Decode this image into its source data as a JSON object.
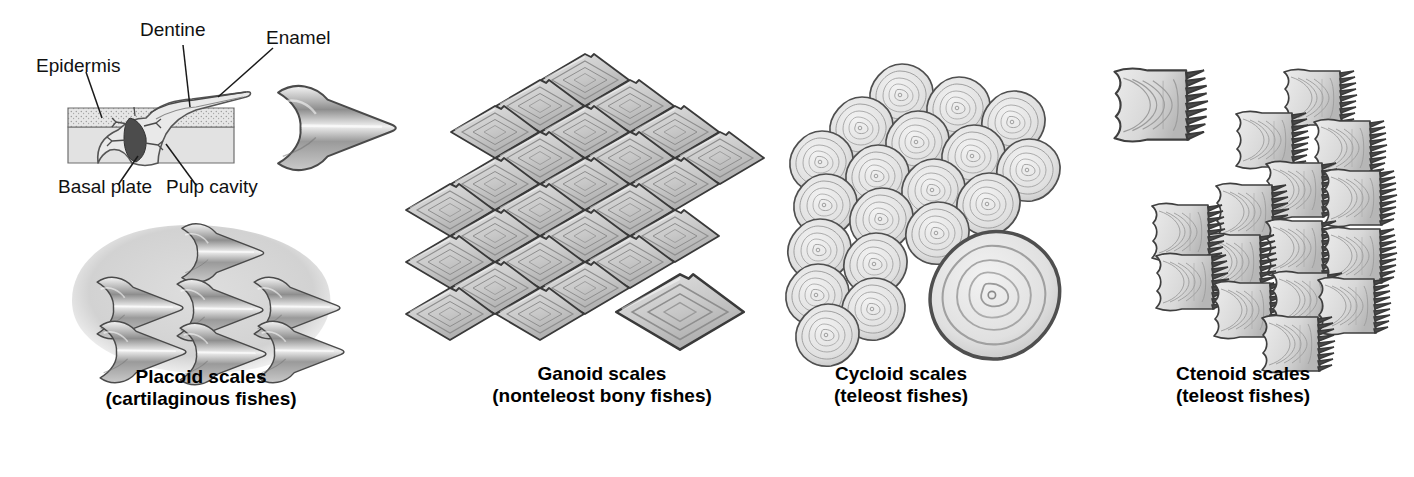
{
  "figure": {
    "background_color": "#ffffff",
    "ink_color": "#2b2b2b",
    "scale_fill": "#d4d4d4",
    "panels": [
      {
        "id": "placoid",
        "caption_line1": "Placoid scales",
        "caption_line2": "(cartilaginous fishes)",
        "anatomy_labels": [
          {
            "id": "epidermis",
            "text": "Epidermis"
          },
          {
            "id": "dentine",
            "text": "Dentine"
          },
          {
            "id": "enamel",
            "text": "Enamel"
          },
          {
            "id": "basal-plate",
            "text": "Basal plate"
          },
          {
            "id": "pulp-cavity",
            "text": "Pulp cavity"
          }
        ]
      },
      {
        "id": "ganoid",
        "caption_line1": "Ganoid scales",
        "caption_line2": "(nonteleost bony fishes)"
      },
      {
        "id": "cycloid",
        "caption_line1": "Cycloid scales",
        "caption_line2": "(teleost fishes)"
      },
      {
        "id": "ctenoid",
        "caption_line1": "Ctenoid scales",
        "caption_line2": "(teleost fishes)"
      }
    ]
  }
}
